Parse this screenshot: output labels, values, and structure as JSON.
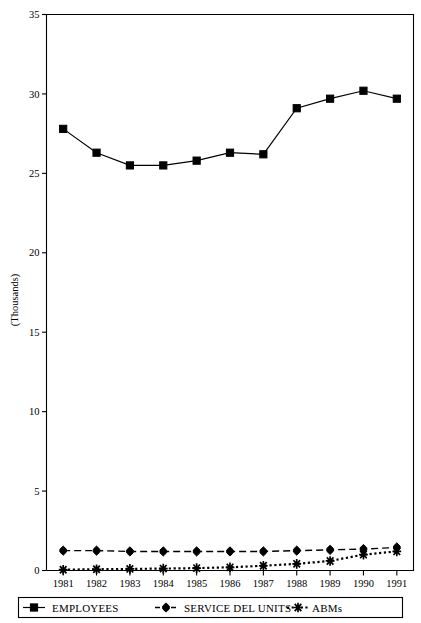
{
  "chart_data": {
    "type": "line",
    "title": "",
    "xlabel": "",
    "ylabel": "(Thousands)",
    "categories": [
      "1981",
      "1982",
      "1983",
      "1984",
      "1985",
      "1986",
      "1987",
      "1988",
      "1989",
      "1990",
      "1991"
    ],
    "ylim": [
      0,
      35
    ],
    "yticks": [
      0,
      5,
      10,
      15,
      20,
      25,
      30,
      35
    ],
    "ytick_labels": [
      "0",
      "5",
      "10",
      "15",
      "20",
      "25",
      "30",
      "35"
    ],
    "grid": false,
    "legend_position": "bottom",
    "series": [
      {
        "name": "EMPLOYEES",
        "marker": "square",
        "line_style": "solid",
        "values": [
          27.8,
          26.3,
          25.5,
          25.5,
          25.8,
          26.3,
          26.2,
          29.1,
          29.7,
          30.2,
          29.7
        ]
      },
      {
        "name": "SERVICE DEL UNITS",
        "marker": "diamond",
        "line_style": "dashed",
        "values": [
          1.25,
          1.25,
          1.2,
          1.2,
          1.2,
          1.2,
          1.2,
          1.25,
          1.3,
          1.35,
          1.45
        ]
      },
      {
        "name": "ABMs",
        "marker": "asterisk",
        "line_style": "dotted",
        "values": [
          0.05,
          0.08,
          0.1,
          0.12,
          0.15,
          0.2,
          0.3,
          0.42,
          0.6,
          1.0,
          1.2
        ]
      }
    ]
  },
  "axis": {
    "y_label": "(Thousands)",
    "y_ticks": [
      "35",
      "30",
      "25",
      "20",
      "15",
      "10",
      "5",
      "0"
    ],
    "x_ticks": [
      "1981",
      "1982",
      "1983",
      "1984",
      "1985",
      "1986",
      "1987",
      "1988",
      "1989",
      "1990",
      "1991"
    ]
  },
  "legend": {
    "items": [
      {
        "label": "EMPLOYEES",
        "marker": "square-marker",
        "style": "solid"
      },
      {
        "label": "SERVICE DEL UNITS",
        "marker": "diamond-marker",
        "style": "dashed"
      },
      {
        "label": "ABMs",
        "marker": "asterisk-marker",
        "style": "dotted"
      }
    ]
  },
  "colors": {
    "ink": "#000000",
    "background": "#ffffff"
  }
}
